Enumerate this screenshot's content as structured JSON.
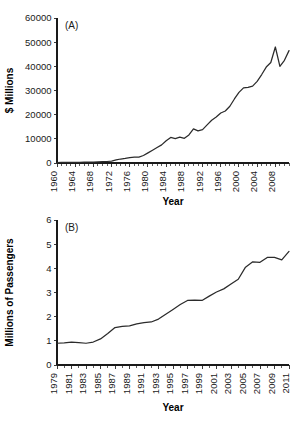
{
  "figure": {
    "background": "#ffffff",
    "line_color": "#2b2b2b",
    "axis_color": "#1a1a1a"
  },
  "chart_data": [
    {
      "type": "line",
      "panel_tag": "(A)",
      "title": "",
      "xlabel": "Year",
      "ylabel": "$ Millions",
      "xlim": [
        1960,
        2011
      ],
      "ylim": [
        0,
        60000
      ],
      "grid": false,
      "legend": "none",
      "yticks": [
        0,
        10000,
        20000,
        30000,
        40000,
        50000,
        60000
      ],
      "ytick_labels": [
        "0",
        "10000",
        "20000",
        "30000",
        "40000",
        "50000",
        "60000"
      ],
      "xticks_major": [
        1960,
        1964,
        1968,
        1972,
        1976,
        1980,
        1984,
        1988,
        1992,
        1996,
        2000,
        2004,
        2008
      ],
      "xtick_labels": [
        "1960",
        "1964",
        "1968",
        "1972",
        "1976",
        "1980",
        "1984",
        "1988",
        "1992",
        "1996",
        "2000",
        "2004",
        "2008"
      ],
      "xtick_minor_step": 1,
      "x": [
        1960,
        1961,
        1962,
        1963,
        1964,
        1965,
        1966,
        1967,
        1968,
        1969,
        1970,
        1971,
        1972,
        1973,
        1974,
        1975,
        1976,
        1977,
        1978,
        1979,
        1980,
        1981,
        1982,
        1983,
        1984,
        1985,
        1986,
        1987,
        1988,
        1989,
        1990,
        1991,
        1992,
        1993,
        1994,
        1995,
        1996,
        1997,
        1998,
        1999,
        2000,
        2001,
        2002,
        2003,
        2004,
        2005,
        2006,
        2007,
        2008,
        2009,
        2010,
        2011
      ],
      "values": [
        200,
        220,
        240,
        260,
        280,
        300,
        330,
        360,
        400,
        450,
        520,
        620,
        800,
        1250,
        1650,
        1900,
        2250,
        2400,
        2450,
        3100,
        4200,
        5300,
        6400,
        7500,
        9200,
        10600,
        10100,
        10700,
        10200,
        11600,
        14100,
        13300,
        13800,
        15800,
        17700,
        19000,
        20700,
        21500,
        23500,
        26500,
        29200,
        31100,
        31300,
        31800,
        33800,
        36600,
        39700,
        41600,
        48000,
        40000,
        42500,
        46500
      ]
    },
    {
      "type": "line",
      "panel_tag": "(B)",
      "title": "",
      "xlabel": "Year",
      "ylabel": "Millions of Passengers",
      "xlim": [
        1979,
        2011
      ],
      "ylim": [
        0,
        6
      ],
      "grid": false,
      "legend": "none",
      "yticks": [
        0,
        1,
        2,
        3,
        4,
        5,
        6
      ],
      "ytick_labels": [
        "0",
        "1",
        "2",
        "3",
        "4",
        "5",
        "6"
      ],
      "xticks_major": [
        1979,
        1981,
        1983,
        1985,
        1987,
        1989,
        1991,
        1993,
        1995,
        1997,
        1999,
        2001,
        2003,
        2005,
        2007,
        2009,
        2011
      ],
      "xtick_labels": [
        "1979",
        "1981",
        "1983",
        "1985",
        "1987",
        "1989",
        "1991",
        "1993",
        "1995",
        "1997",
        "1999",
        "2001",
        "2003",
        "2005",
        "2007",
        "2009",
        "2011"
      ],
      "xtick_minor_step": 1,
      "x": [
        1979,
        1980,
        1981,
        1982,
        1983,
        1984,
        1985,
        1986,
        1987,
        1988,
        1989,
        1990,
        1991,
        1992,
        1993,
        1994,
        1995,
        1996,
        1997,
        1998,
        1999,
        2000,
        2001,
        2002,
        2003,
        2004,
        2005,
        2006,
        2007,
        2008,
        2009,
        2010,
        2011
      ],
      "values": [
        0.9,
        0.92,
        0.95,
        0.93,
        0.9,
        0.95,
        1.08,
        1.3,
        1.55,
        1.6,
        1.62,
        1.7,
        1.75,
        1.78,
        1.9,
        2.1,
        2.3,
        2.5,
        2.67,
        2.68,
        2.67,
        2.85,
        3.02,
        3.15,
        3.35,
        3.55,
        4.05,
        4.27,
        4.25,
        4.45,
        4.45,
        4.35,
        4.7
      ]
    }
  ]
}
